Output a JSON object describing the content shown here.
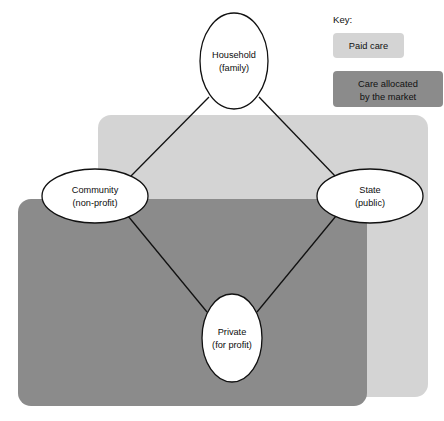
{
  "diagram": {
    "nodes": [
      {
        "id": "household",
        "line1": "Household",
        "line2": "(family)",
        "cx": 234,
        "cy": 61,
        "rx": 34,
        "ry": 48
      },
      {
        "id": "community",
        "line1": "Community",
        "line2": "(non-profit)",
        "cx": 95,
        "cy": 196,
        "rx": 53,
        "ry": 27
      },
      {
        "id": "state",
        "line1": "State",
        "line2": "(public)",
        "cx": 370,
        "cy": 196,
        "rx": 53,
        "ry": 27
      },
      {
        "id": "private",
        "line1": "Private",
        "line2": "(for profit)",
        "cx": 232,
        "cy": 338,
        "rx": 30,
        "ry": 44
      }
    ],
    "connectors": [
      {
        "from": "household",
        "to": "community",
        "x1": 209,
        "y1": 97,
        "x2": 131,
        "y2": 176
      },
      {
        "from": "household",
        "to": "state",
        "x1": 259,
        "y1": 97,
        "x2": 336,
        "y2": 177
      },
      {
        "from": "community",
        "to": "private",
        "x1": 128,
        "y1": 216,
        "x2": 207,
        "y2": 312
      },
      {
        "from": "state",
        "to": "private",
        "x1": 336,
        "y1": 216,
        "x2": 257,
        "y2": 312
      }
    ],
    "regions": [
      {
        "id": "paid-care-region",
        "name": "Paid care region",
        "x": 98,
        "y": 115,
        "width": 330,
        "height": 282,
        "radius": 13,
        "color": "#d4d4d4"
      },
      {
        "id": "market-care-region",
        "name": "Care allocated by the market region",
        "x": 18,
        "y": 199,
        "width": 349,
        "height": 207,
        "radius": 13,
        "color": "#8b8b8b"
      }
    ]
  },
  "key": {
    "title": "Key:",
    "items": [
      {
        "id": "paid-care",
        "line1": "Paid care",
        "line2": "",
        "color": "#d4d4d4",
        "x": 333,
        "y": 33,
        "width": 71,
        "height": 25,
        "radius": 4
      },
      {
        "id": "market-care",
        "line1": "Care allocated",
        "line2": "by the market",
        "color": "#8b8b8b",
        "x": 333,
        "y": 71,
        "width": 110,
        "height": 36,
        "radius": 4
      }
    ]
  }
}
